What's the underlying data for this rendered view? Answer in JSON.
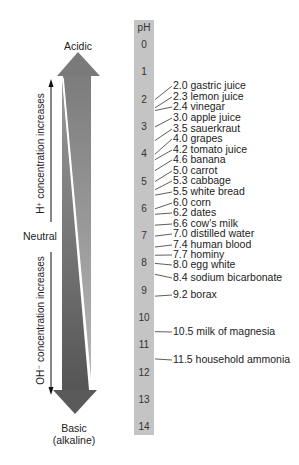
{
  "diagram": {
    "top_label": "Acidic",
    "bottom_label_line1": "Basic",
    "bottom_label_line2": "(alkaline)",
    "neutral_label": "Neutral",
    "h_label": "H⁺ concentration increases",
    "oh_label": "OH⁻ concentration increases",
    "scale_header": "pH",
    "scale_ticks": [
      "0",
      "1",
      "2",
      "3",
      "4",
      "5",
      "6",
      "7",
      "8",
      "9",
      "10",
      "11",
      "12",
      "13",
      "14"
    ],
    "substances": [
      {
        "ph": 2.0,
        "text": "2.0 gastric juice"
      },
      {
        "ph": 2.3,
        "text": "2.3 lemon juice"
      },
      {
        "ph": 2.4,
        "text": "2.4 vinegar"
      },
      {
        "ph": 3.0,
        "text": "3.0 apple juice"
      },
      {
        "ph": 3.5,
        "text": "3.5 sauerkraut"
      },
      {
        "ph": 4.0,
        "text": "4.0 grapes"
      },
      {
        "ph": 4.2,
        "text": "4.2 tomato juice"
      },
      {
        "ph": 4.6,
        "text": "4.6 banana"
      },
      {
        "ph": 5.0,
        "text": "5.0 carrot"
      },
      {
        "ph": 5.3,
        "text": "5.3 cabbage"
      },
      {
        "ph": 5.5,
        "text": "5.5 white bread"
      },
      {
        "ph": 6.0,
        "text": "6.0 corn"
      },
      {
        "ph": 6.2,
        "text": "6.2 dates"
      },
      {
        "ph": 6.6,
        "text": "6.6 cow's milk"
      },
      {
        "ph": 7.0,
        "text": "7.0 distilled water"
      },
      {
        "ph": 7.4,
        "text": "7.4 human blood"
      },
      {
        "ph": 7.7,
        "text": "7.7 hominy"
      },
      {
        "ph": 8.0,
        "text": "8.0 egg white"
      },
      {
        "ph": 8.4,
        "text": "8.4 sodium bicarbonate"
      },
      {
        "ph": 9.2,
        "text": "9.2 borax"
      },
      {
        "ph": 10.5,
        "text": "10.5 milk of magnesia"
      },
      {
        "ph": 11.5,
        "text": "11.5 household ammonia"
      }
    ],
    "colors": {
      "arrow_dark": "#5a5a5a",
      "arrow_mid": "#8a8a8a",
      "bar": "#c4c4c4"
    }
  }
}
